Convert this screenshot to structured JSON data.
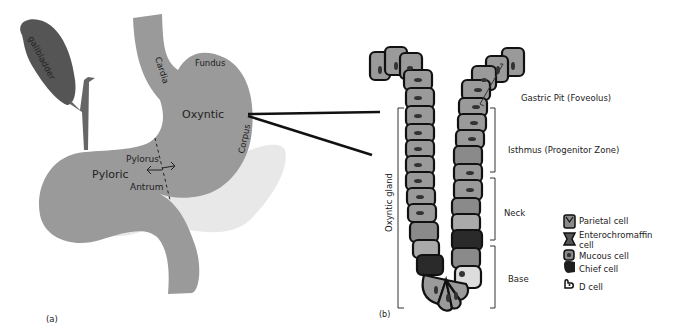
{
  "panel_a": {
    "caption": "(a)",
    "labels": {
      "gallbladder": "gallbladder",
      "cardia": "Cardia",
      "fundus": "Fundus",
      "oxyntic": "Oxyntic",
      "corpus": "Corpus",
      "pylorus": "Pylorus",
      "pyloric": "Pyloric",
      "antrum": "Antrum"
    }
  },
  "panel_b": {
    "caption": "(b)",
    "regions": {
      "gastric_pit": "Gastric Pit (Foveolus)",
      "isthmus": "Isthmus (Progenitor Zone)",
      "neck": "Neck",
      "base": "Base",
      "oxyntic_gland": "Oxyntic gland"
    },
    "legend": [
      {
        "icon": "parietal-cell-icon",
        "label": "Parietal cell"
      },
      {
        "icon": "enterochromaffin-cell-icon",
        "label": "Enterochromaffin",
        "label2": "cell"
      },
      {
        "icon": "mucous-cell-icon",
        "label": "Mucous cell"
      },
      {
        "icon": "chief-cell-icon",
        "label": "Chief cell"
      },
      {
        "icon": "d-cell-icon",
        "label": "D cell"
      }
    ]
  },
  "colors": {
    "stomach": "#999999",
    "gallbladder": "#555555",
    "pancreas": "#e8e8e8",
    "cell": "#9a9a9a",
    "chief": "#2a2a2a",
    "outline": "#111111"
  }
}
